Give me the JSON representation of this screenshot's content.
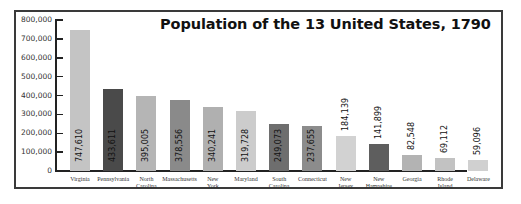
{
  "chart_data": {
    "type": "bar",
    "title": "Population of the 13 United States, 1790",
    "xlabel": "",
    "ylabel": "",
    "ylim": [
      0,
      800000
    ],
    "yticks": [
      "0",
      "100,000",
      "200,000",
      "300,000",
      "400,000",
      "500,000",
      "600,000",
      "700,000",
      "800,000"
    ],
    "grid": false,
    "legend": null,
    "categories": [
      "Virginia",
      "Pennsylvania",
      "North Carolina",
      "Massachusetts",
      "New York",
      "Maryland",
      "South Carolina",
      "Connecticut",
      "New Jersey",
      "New Hampshire",
      "Georgia",
      "Rhode Island",
      "Delaware"
    ],
    "category_lines": [
      [
        "Virginia"
      ],
      [
        "Pennsylvania"
      ],
      [
        "North",
        "Carolina"
      ],
      [
        "Massachusetts"
      ],
      [
        "New",
        "York"
      ],
      [
        "Maryland"
      ],
      [
        "South",
        "Carolina"
      ],
      [
        "Connecticut"
      ],
      [
        "New",
        "Jersey"
      ],
      [
        "New",
        "Hampshire"
      ],
      [
        "Georgia"
      ],
      [
        "Rhode",
        "Island"
      ],
      [
        "Delaware"
      ]
    ],
    "values": [
      747610,
      433611,
      395005,
      378556,
      340241,
      319728,
      249073,
      237655,
      184139,
      141899,
      82548,
      69112,
      59096
    ],
    "value_labels": [
      "747,610",
      "433,611",
      "395,005",
      "378,556",
      "340,241",
      "319,728",
      "249,073",
      "237,655",
      "184,139",
      "141,899",
      "82,548",
      "69,112",
      "59,096"
    ],
    "bar_colors": [
      "#c4c4c4",
      "#4a4a4a",
      "#b5b5b5",
      "#8a8a8a",
      "#b0b0b0",
      "#cccccc",
      "#6e6e6e",
      "#8c8c8c",
      "#d2d2d2",
      "#5e5e5e",
      "#b3b3b3",
      "#c2c2c2",
      "#d0d0d0"
    ],
    "label_inside": [
      true,
      true,
      true,
      true,
      true,
      true,
      true,
      true,
      false,
      false,
      false,
      false,
      false
    ]
  }
}
